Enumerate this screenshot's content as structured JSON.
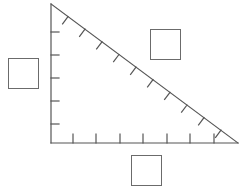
{
  "figure": {
    "stroke_color": "#555555",
    "box_border_color": "#6b6b6b",
    "background_color": "#ffffff",
    "stroke_width": 1.2,
    "vertices": {
      "apex": [
        51,
        4
      ],
      "right_angle": [
        51,
        143
      ],
      "bottom_right": [
        238,
        143
      ]
    },
    "legs": {
      "vertical_label": "vertical-leg",
      "horizontal_label": "horizontal-leg",
      "hypotenuse_label": "hypotenuse"
    },
    "ticks": {
      "vertical_count": 5,
      "vertical_length": 8,
      "vertical_positions_y": [
        32,
        55,
        78,
        101,
        124
      ],
      "horizontal_count": 8,
      "horizontal_length": 8,
      "horizontal_positions_x": [
        73,
        96,
        120,
        143,
        167,
        190,
        214,
        73
      ],
      "hypotenuse_count": 10,
      "hypotenuse_length": 9
    }
  },
  "boxes": [
    {
      "id": "box-left",
      "name": "answer-box-left",
      "text": "",
      "x": 8,
      "y": 58,
      "size": 31
    },
    {
      "id": "box-top",
      "name": "answer-box-top-right",
      "text": "",
      "x": 150,
      "y": 29,
      "size": 31
    },
    {
      "id": "box-bottom",
      "name": "answer-box-bottom",
      "text": "",
      "x": 131,
      "y": 155,
      "size": 31
    }
  ]
}
